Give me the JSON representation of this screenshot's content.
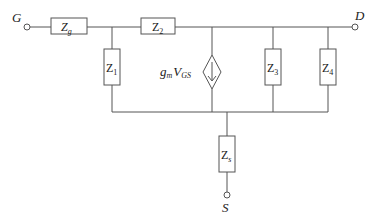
{
  "terminals": {
    "gate": "G",
    "drain": "D",
    "source": "S"
  },
  "components": {
    "zg": {
      "main": "Z",
      "sub": "g"
    },
    "z1": {
      "main": "Z",
      "sub": "1"
    },
    "z2": {
      "main": "Z",
      "sub": "2"
    },
    "z3": {
      "main": "Z",
      "sub": "3"
    },
    "z4": {
      "main": "Z",
      "sub": "4"
    },
    "zs": {
      "main": "Z",
      "sub": "s"
    }
  },
  "dependent_source": {
    "gain": "g",
    "gain_sub": "m",
    "control": "V",
    "control_sub": "GS",
    "icon": "dependent-current-source-diamond-arrow-down"
  },
  "colors": {
    "wire": "#555555",
    "text": "#222222",
    "background": "#ffffff"
  }
}
